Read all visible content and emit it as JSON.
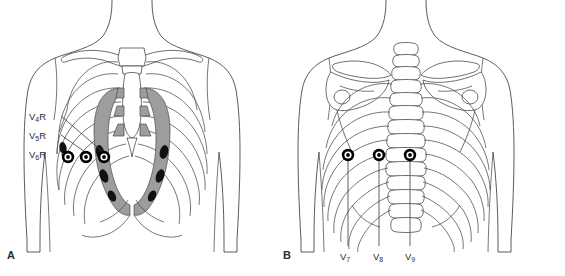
{
  "figure": {
    "background_color": "#ffffff",
    "ink_color": "#3a3a3a",
    "cartilage_shade": "#9a9a9a",
    "electrode_color": "#000000",
    "width": 565,
    "height": 276
  },
  "panels": [
    {
      "id": "A",
      "letter": "A",
      "view": "anterior-torso",
      "description": "Anterior chest with clavicles, sternum, ribs and shaded costal cartilage",
      "electrodes": [
        {
          "label": "V4R",
          "letter": "V",
          "subscript": "4",
          "suffix": "R",
          "cx": 68,
          "cy": 157
        },
        {
          "label": "V5R",
          "letter": "V",
          "subscript": "5",
          "suffix": "R",
          "cx": 86,
          "cy": 157
        },
        {
          "label": "V6R",
          "letter": "V",
          "subscript": "6",
          "suffix": "R",
          "cx": 104,
          "cy": 157
        }
      ],
      "labels": [
        {
          "letter": "V",
          "subscript": "4",
          "suffix": "R",
          "x": 29,
          "y": 112
        },
        {
          "letter": "V",
          "subscript": "5",
          "suffix": "R",
          "x": 29,
          "y": 131
        },
        {
          "letter": "V",
          "subscript": "6",
          "suffix": "R",
          "x": 29,
          "y": 150
        }
      ]
    },
    {
      "id": "B",
      "letter": "B",
      "view": "posterior-torso",
      "description": "Posterior chest with scapulae, vertebral column and ribs",
      "electrodes": [
        {
          "label": "V7",
          "letter": "V",
          "subscript": "7",
          "suffix": "",
          "cx": 348,
          "cy": 155
        },
        {
          "label": "V8",
          "letter": "V",
          "subscript": "8",
          "suffix": "",
          "cx": 379,
          "cy": 155
        },
        {
          "label": "V9",
          "letter": "V",
          "subscript": "9",
          "suffix": "",
          "cx": 410,
          "cy": 155
        }
      ],
      "labels": [
        {
          "letter": "V",
          "subscript": "7",
          "suffix": "",
          "x": 340,
          "y": 252
        },
        {
          "letter": "V",
          "subscript": "8",
          "suffix": "",
          "x": 373,
          "y": 252
        },
        {
          "letter": "V",
          "subscript": "9",
          "suffix": "",
          "x": 405,
          "y": 252
        }
      ]
    }
  ]
}
